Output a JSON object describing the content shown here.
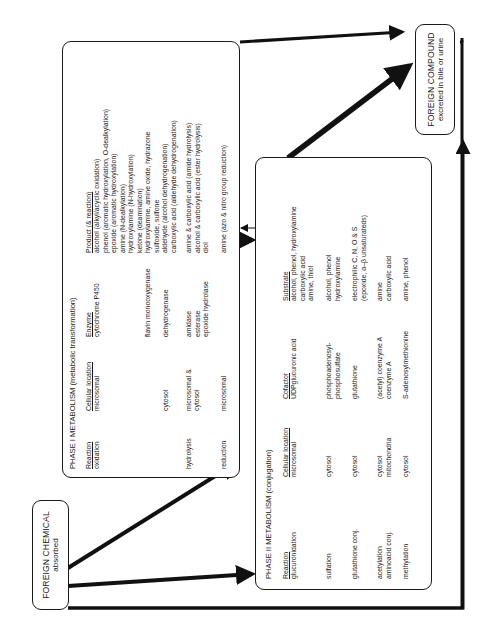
{
  "foreign_chemical": {
    "line1": "FOREIGN CHEMICAL",
    "line2": "absorbed"
  },
  "excreted": {
    "line1": "FOREIGN COMPOUND",
    "line2": "excreted in bile or urine"
  },
  "phase1": {
    "title": "PHASE I METABOLISM (metabolic transformation)",
    "headers": {
      "reaction": "Reaction",
      "location": "Cellular location",
      "enzyme": "Enzyme",
      "product": "Product (& reaction)"
    },
    "rows": [
      {
        "reaction": "oxidation",
        "location": "microsomal",
        "enzyme": "cytochrome P450",
        "products": [
          "alcohol (alkyl/acyclic oxidation)",
          "phenol (aromatic hydroxylation, O-dealkylation)",
          "epoxide (aromatic hydroxylation)",
          "amine (N-dealkylation)",
          "hydroxylamine (N-hydroxylation)",
          "ketone (deamination)"
        ]
      },
      {
        "reaction": "",
        "location": "",
        "enzyme": "flavin monooxygenase",
        "products": [
          "hydroxylamine, amine oxide, hydrazone",
          "sulfoxide, sulfone"
        ]
      },
      {
        "reaction": "",
        "location": "cytosol",
        "enzyme": "dehydrogenase",
        "products": [
          "aldehyde (alcohol dehydrogenation)",
          "carboxylic acid (aldehyde dehydrogenation)"
        ]
      },
      {
        "reaction": "hydrolysis",
        "location": "microsomal & cytosol",
        "enzyme": "amidase",
        "products": [
          "amine & carboxylic acid (amide hydrolysis)"
        ]
      },
      {
        "reaction": "",
        "location": "",
        "enzyme": "esterase",
        "products": [
          "alcohol & carboxylic acid (ester hydrolysis)"
        ]
      },
      {
        "reaction": "",
        "location": "",
        "enzyme": "epoxide hydrolase",
        "products": [
          "diol"
        ]
      },
      {
        "reaction": "reduction",
        "location": "microsomal",
        "enzyme": "",
        "products": [
          "amine (azo & nitro group reduction)"
        ]
      }
    ]
  },
  "phase2": {
    "title": "PHASE II METABOLISM (conjugation)",
    "headers": {
      "reaction": "Reaction",
      "location": "Cellular location",
      "cofactor": "Cofactor",
      "substrate": "Substrate"
    },
    "rows": [
      {
        "reaction": [
          "glucuronidation"
        ],
        "location": [
          "microsomal"
        ],
        "cofactor": [
          "UDPglucuronic acid"
        ],
        "substrate": [
          "alcohol, phenol, hydroxylamine",
          "carboxylic acid",
          "amine, thiol"
        ]
      },
      {
        "reaction": [
          "sulfation"
        ],
        "location": [
          "cytosol"
        ],
        "cofactor": [
          "phosphoadenosyl-",
          "phosphosulfate"
        ],
        "substrate": [
          "alcohol, phenol",
          "hydroxylamine"
        ]
      },
      {
        "reaction": [
          "glutathione conj."
        ],
        "location": [
          "cytosol"
        ],
        "cofactor": [
          "glutathione"
        ],
        "substrate": [
          "electrophilic C, N, O & S",
          "(epoxide, α–β unsaturateds)"
        ]
      },
      {
        "reaction": [
          "acetylation",
          "aminoacid conj."
        ],
        "location": [
          "cytosol",
          "mitochondria"
        ],
        "cofactor": [
          "(acetyl) coenzyme A",
          "coenzyme A"
        ],
        "substrate": [
          "amine",
          "carboxylic acid"
        ]
      },
      {
        "reaction": [
          "methylation"
        ],
        "location": [
          "cytosol"
        ],
        "cofactor": [
          "S-adenosylmethionine"
        ],
        "substrate": [
          "amine, phenol"
        ]
      }
    ]
  }
}
